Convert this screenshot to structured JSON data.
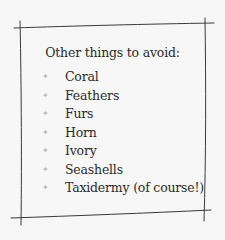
{
  "card": {
    "title": "Other things to avoid:",
    "bullet_icon": "✦",
    "items": [
      {
        "label": "Coral"
      },
      {
        "label": "Feathers"
      },
      {
        "label": "Furs"
      },
      {
        "label": "Horn"
      },
      {
        "label": "Ivory"
      },
      {
        "label": "Seashells"
      },
      {
        "label": "Taxidermy (of course!)"
      }
    ]
  }
}
